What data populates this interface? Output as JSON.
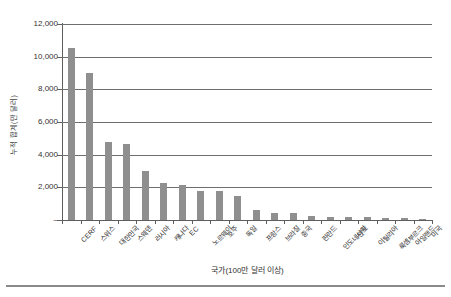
{
  "chart_data": {
    "type": "bar",
    "title": "",
    "xlabel": "국가(100만 달러 이상)",
    "ylabel": "누적 합계(만 달러)",
    "ylim": [
      0,
      12000
    ],
    "ytick_labels": [
      "12,000",
      "10,000",
      "8,000",
      "6,000",
      "4,000",
      "2,000",
      "–"
    ],
    "ytick_values": [
      12000,
      10000,
      8000,
      6000,
      4000,
      2000,
      0
    ],
    "grid": true,
    "legend": "none",
    "bar_color": "#8f8f8f",
    "categories": [
      "CERF",
      "스위스",
      "대한민국",
      "스웨덴",
      "러시아",
      "캐나다",
      "EC",
      "노르웨이",
      "호주",
      "독일",
      "프랑스",
      "브라질",
      "중국",
      "핀란드",
      "인도네시아",
      "인도",
      "이탈리아",
      "룩셈부르크",
      "아일랜드",
      "미국"
    ],
    "values": [
      10550,
      9000,
      4780,
      4650,
      2980,
      2250,
      2130,
      1800,
      1760,
      1450,
      600,
      450,
      430,
      220,
      200,
      215,
      200,
      130,
      120,
      60
    ]
  },
  "figure": {
    "background": "#ffffff",
    "axis_color": "#5e5e5e",
    "gridline_color": "#6e6e6e"
  }
}
